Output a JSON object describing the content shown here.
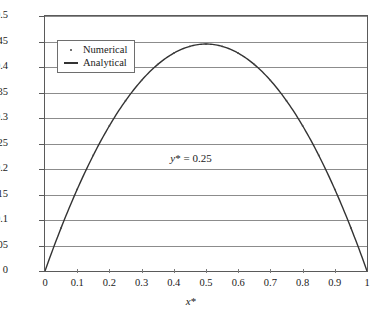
{
  "chart_data": {
    "type": "line",
    "title": "",
    "xlabel": "x*",
    "ylabel": "",
    "xlim": [
      0,
      1
    ],
    "ylim": [
      0,
      0.5
    ],
    "grid": true,
    "legend_position": "top-left",
    "annotations": [
      {
        "text_italic": "y",
        "text_star": "*",
        "text_rest": " = 0.25",
        "x": 0.5,
        "y": 0.25
      }
    ],
    "xticks": [
      "0",
      "0.1",
      "0.2",
      "0.3",
      "0.4",
      "0.5",
      "0.6",
      "0.7",
      "0.8",
      "0.9",
      "1"
    ],
    "xtick_values": [
      0,
      0.1,
      0.2,
      0.3,
      0.4,
      0.5,
      0.6,
      0.7,
      0.8,
      0.9,
      1
    ],
    "yticks": [
      "0",
      "0.05",
      "0.1",
      "0.15",
      "0.2",
      "0.25",
      "0.3",
      "0.35",
      "0.4",
      "0.45",
      "0.5"
    ],
    "ytick_values": [
      0,
      0.05,
      0.1,
      0.15,
      0.2,
      0.25,
      0.3,
      0.35,
      0.4,
      0.45,
      0.5
    ],
    "series": [
      {
        "name": "Numerical",
        "marker": "dot",
        "color": "#444444",
        "x": [
          0,
          0.05,
          0.1,
          0.15,
          0.2,
          0.25,
          0.3,
          0.35,
          0.4,
          0.45,
          0.5,
          0.55,
          0.6,
          0.65,
          0.7,
          0.75,
          0.8,
          0.85,
          0.9,
          0.95,
          1
        ],
        "values": [
          0,
          0.0845,
          0.1602,
          0.227,
          0.2848,
          0.3338,
          0.3738,
          0.405,
          0.4272,
          0.4406,
          0.445,
          0.4406,
          0.4272,
          0.405,
          0.3738,
          0.3338,
          0.2848,
          0.227,
          0.1602,
          0.0845,
          0
        ]
      },
      {
        "name": "Analytical",
        "marker": "line",
        "color": "#333333",
        "x": [
          0,
          0.05,
          0.1,
          0.15,
          0.2,
          0.25,
          0.3,
          0.35,
          0.4,
          0.45,
          0.5,
          0.55,
          0.6,
          0.65,
          0.7,
          0.75,
          0.8,
          0.85,
          0.9,
          0.95,
          1
        ],
        "values": [
          0,
          0.0845,
          0.1602,
          0.227,
          0.2848,
          0.3338,
          0.3738,
          0.405,
          0.4272,
          0.4406,
          0.445,
          0.4406,
          0.4272,
          0.405,
          0.3738,
          0.3338,
          0.2848,
          0.227,
          0.1602,
          0.0845,
          0
        ]
      }
    ],
    "peak_value": 0.445,
    "peak_x": 0.5
  },
  "legend": {
    "items": [
      {
        "label": "Numerical"
      },
      {
        "label": "Analytical"
      }
    ]
  },
  "axis": {
    "x_title_italic": "x",
    "x_title_star": "*"
  },
  "colors": {
    "frame": "#5a5a5a",
    "grid": "#8c8c8c",
    "curve": "#333333",
    "text": "#1a1a1a"
  }
}
